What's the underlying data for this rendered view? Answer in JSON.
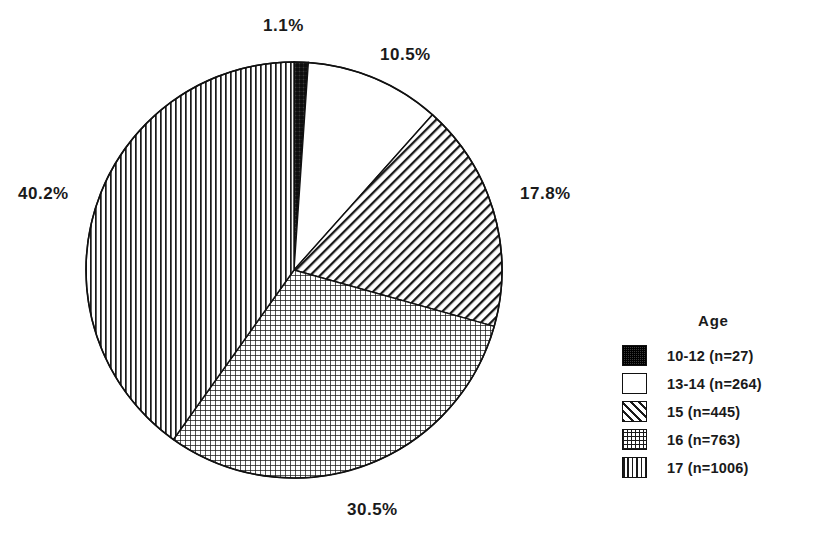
{
  "chart_data": {
    "type": "pie",
    "title": "",
    "legend_title": "Age",
    "legend_position": "right",
    "total_n": 2505,
    "categories": [
      "10-12",
      "13-14",
      "15",
      "16",
      "17"
    ],
    "values": [
      1.1,
      10.5,
      17.8,
      30.5,
      40.2
    ],
    "counts": [
      27,
      264,
      445,
      763,
      1006
    ],
    "value_unit": "%",
    "start_angle_deg": 0,
    "direction": "clockwise",
    "slices": [
      {
        "category": "10-12",
        "percent_label": "1.1%",
        "percent": 1.1,
        "count": 27,
        "legend_label": "10-12 (n=27)",
        "pattern": "dense-dark-crosshatch",
        "fill": "#2b2b2b"
      },
      {
        "category": "13-14",
        "percent_label": "10.5%",
        "percent": 10.5,
        "count": 264,
        "legend_label": "13-14 (n=264)",
        "pattern": "solid-white",
        "fill": "#ffffff"
      },
      {
        "category": "15",
        "percent_label": "17.8%",
        "percent": 17.8,
        "count": 445,
        "legend_label": "15 (n=445)",
        "pattern": "diagonal-stripes",
        "fill": "#ffffff"
      },
      {
        "category": "16",
        "percent_label": "30.5%",
        "percent": 30.5,
        "count": 763,
        "legend_label": "16 (n=763)",
        "pattern": "fine-grid-crosshatch",
        "fill": "#ffffff"
      },
      {
        "category": "17",
        "percent_label": "40.2%",
        "percent": 40.2,
        "count": 1006,
        "legend_label": "17 (n=1006)",
        "pattern": "vertical-lines",
        "fill": "#ffffff"
      }
    ],
    "xlabel": "",
    "ylabel": "",
    "grid": false,
    "colors": {
      "outline": "#111111",
      "text": "#1a1a1a",
      "background": "#ffffff",
      "dark_slice": "#2b2b2b"
    }
  },
  "geometry": {
    "center_x": 294,
    "center_y": 270,
    "radius": 208
  },
  "legend": {
    "title": "Age",
    "items": [
      {
        "label": "10-12 (n=27)"
      },
      {
        "label": "13-14 (n=264)"
      },
      {
        "label": "15 (n=445)"
      },
      {
        "label": "16 (n=763)"
      },
      {
        "label": "17 (n=1006)"
      }
    ]
  },
  "labels": {
    "slice_10_12": "1.1%",
    "slice_13_14": "10.5%",
    "slice_15": "17.8%",
    "slice_16": "30.5%",
    "slice_17": "40.2%"
  }
}
